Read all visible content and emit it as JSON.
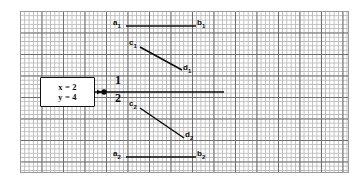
{
  "figure": {
    "type": "diagram",
    "canvas": {
      "width": 362,
      "height": 183
    },
    "grid": {
      "left": 20,
      "top": 11,
      "width": 329,
      "height": 162,
      "minor_spacing_px": 4.3,
      "major_spacing_px": 21.5,
      "minor_color": "#b9b9b9",
      "major_color": "#6e6e6e",
      "border_color": "#9a9a9a"
    },
    "value_box": {
      "lines": [
        "x = 2",
        "y = 4"
      ],
      "x": 40,
      "y": 77,
      "width": 55,
      "height": 30,
      "border_color": "#111111"
    },
    "node": {
      "x": 104,
      "y": 92,
      "radius": 2.6,
      "color": "#0b0b0b"
    },
    "incoming_arrow": {
      "from_x": 89,
      "to_x": 101,
      "y": 92
    },
    "branch_numbers": [
      {
        "text": "1",
        "x": 116,
        "y": 80
      },
      {
        "text": "2",
        "x": 116,
        "y": 96
      }
    ],
    "segments": [
      {
        "name": "a1-b1",
        "x1": 126,
        "y1": 26,
        "x2": 196,
        "y2": 26
      },
      {
        "name": "c1-d1",
        "x1": 140,
        "y1": 47,
        "x2": 182,
        "y2": 70
      },
      {
        "name": "main-branch",
        "x1": 104,
        "y1": 92,
        "x2": 224,
        "y2": 92
      },
      {
        "name": "c2-d2",
        "x1": 140,
        "y1": 108,
        "x2": 184,
        "y2": 138
      },
      {
        "name": "a2-b2",
        "x1": 126,
        "y1": 157,
        "x2": 196,
        "y2": 157
      }
    ],
    "labels": [
      {
        "id": "a1",
        "base": "a",
        "sub": "1",
        "x": 113,
        "y": 21
      },
      {
        "id": "b1",
        "base": "b",
        "sub": "1",
        "x": 197,
        "y": 21
      },
      {
        "id": "c1",
        "base": "c",
        "sub": "1",
        "x": 130,
        "y": 41
      },
      {
        "id": "d1",
        "base": "d",
        "sub": "1",
        "x": 183,
        "y": 66
      },
      {
        "id": "c2",
        "base": "c",
        "sub": "2",
        "x": 130,
        "y": 102
      },
      {
        "id": "d2",
        "base": "d",
        "sub": "2",
        "x": 185,
        "y": 133
      },
      {
        "id": "a2",
        "base": "a",
        "sub": "2",
        "x": 113,
        "y": 152
      },
      {
        "id": "b2",
        "base": "b",
        "sub": "2",
        "x": 197,
        "y": 152
      }
    ],
    "line_color": "#0b0b0b"
  }
}
